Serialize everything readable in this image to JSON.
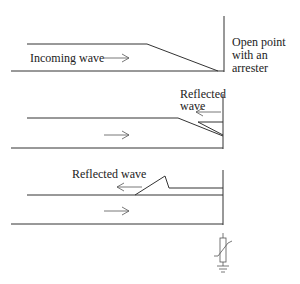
{
  "panels": [
    {
      "id": "incoming",
      "label": "Incoming wave",
      "arrow_direction": "right"
    },
    {
      "id": "reflected-start",
      "label_line1": "Reflected",
      "label_line2": "wave",
      "arrow_direction": "left",
      "forward_arrow_direction": "right"
    },
    {
      "id": "reflected-travel",
      "label": "Reflected wave",
      "arrow_direction": "left",
      "forward_arrow_direction": "right"
    }
  ],
  "termination": {
    "label_line1": "Open point",
    "label_line2": "with an",
    "label_line3": "arrester"
  },
  "arrester_symbol": "surge-arrester-to-ground",
  "colors": {
    "line": "#333333",
    "background": "#ffffff"
  }
}
